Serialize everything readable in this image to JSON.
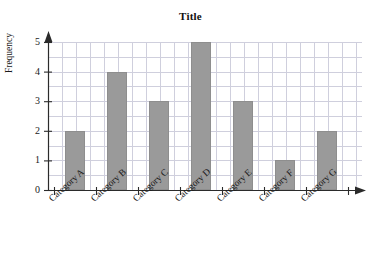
{
  "chart_data": {
    "type": "bar",
    "title": "Title",
    "xlabel": "",
    "ylabel": "Frequency",
    "categories": [
      "Category A",
      "Category B",
      "Category C",
      "Category D",
      "Category E",
      "Category F",
      "Category G"
    ],
    "values": [
      2,
      4,
      3,
      5,
      3,
      1,
      2
    ],
    "ylim": [
      0,
      5
    ],
    "ytick_labels": [
      "0",
      "1",
      "2",
      "3",
      "4",
      "5"
    ],
    "ytick_values": [
      0,
      1,
      2,
      3,
      4,
      5
    ],
    "grid": true,
    "legend": "none",
    "bar_color": "#9a9a9a",
    "grid_color": "#cfcfdd",
    "axis_color": "#2b2b2b",
    "axis_arrows": {
      "y_axis_arrow": "up-arrow",
      "x_axis_arrow": "right-arrow"
    }
  },
  "axis_titles": {
    "y": "Frequency"
  }
}
